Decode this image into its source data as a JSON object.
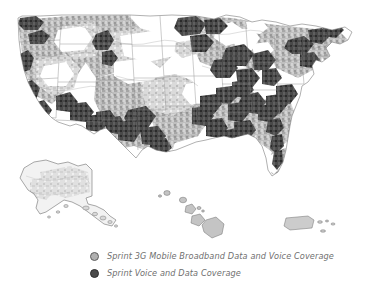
{
  "figure": {
    "kind": "coverage-map",
    "region_label": "United States",
    "background_color": "#ffffff"
  },
  "map": {
    "insets": [
      {
        "name": "alaska",
        "label": "Alaska"
      },
      {
        "name": "hawaii",
        "label": "Hawaii"
      },
      {
        "name": "puerto-rico",
        "label": "Puerto Rico"
      }
    ],
    "colors": {
      "light_coverage": "#b3b3b3",
      "dark_coverage": "#3c3c3c",
      "no_coverage": "#ffffff",
      "outline": "#8a8a8a"
    }
  },
  "legend": {
    "items": [
      {
        "swatch_name": "legend-swatch-3g",
        "label": "Sprint 3G Mobile Broadband Data and Voice Coverage",
        "fill": "#b0b0b0",
        "stroke": "#5d5d5d"
      },
      {
        "swatch_name": "legend-swatch-voice-data",
        "label": "Sprint Voice and Data Coverage",
        "fill": "#4a4a4a",
        "stroke": "#2e2e2e"
      }
    ]
  }
}
